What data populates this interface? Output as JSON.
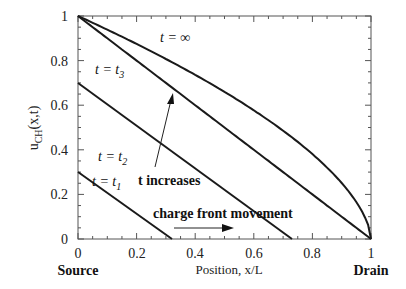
{
  "chart_data": {
    "type": "line",
    "title": "",
    "xlabel": "Position, x/L",
    "ylabel": "u_CH(x,t)",
    "xlim": [
      0,
      1
    ],
    "ylim": [
      0,
      1
    ],
    "grid": false,
    "x_ticks": [
      "0",
      "0.2",
      "0.4",
      "0.6",
      "0.8",
      "1"
    ],
    "y_ticks": [
      "0",
      "0.2",
      "0.4",
      "0.6",
      "0.8",
      "1"
    ],
    "series": [
      {
        "name": "t = t1",
        "x": [
          0,
          0.32
        ],
        "y": [
          0.3,
          0
        ]
      },
      {
        "name": "t = t2",
        "x": [
          0,
          0.73
        ],
        "y": [
          0.7,
          0
        ]
      },
      {
        "name": "t = t3",
        "x": [
          0,
          0.25,
          0.5,
          0.72,
          1
        ],
        "y": [
          1,
          0.75,
          0.5,
          0.28,
          0
        ]
      },
      {
        "name": "t = ∞",
        "x": [
          0,
          0.25,
          0.5,
          0.72,
          0.9,
          1
        ],
        "y": [
          1,
          0.84,
          0.66,
          0.46,
          0.25,
          0
        ]
      }
    ],
    "annotations": [
      {
        "text": "t increases",
        "type": "arrow",
        "from": [
          0.26,
          0.16
        ],
        "to": [
          0.32,
          0.59
        ]
      },
      {
        "text": "charge front movement",
        "type": "arrow",
        "from": [
          0.32,
          0.05
        ],
        "to": [
          0.55,
          0.05
        ]
      },
      {
        "text": "Source",
        "at_x": 0
      },
      {
        "text": "Drain",
        "at_x": 1
      }
    ]
  },
  "labels": {
    "ylabel_main": "u",
    "ylabel_sub": "CH",
    "ylabel_tail": "(x,t)",
    "xlabel": "Position, x/L",
    "source": "Source",
    "drain": "Drain",
    "t_increases": "t  increases",
    "charge_front": "charge  front  movement",
    "t_inf": "t = ∞",
    "t3_main": "t = t",
    "t3_sub": "3",
    "t2_main": "t = t",
    "t2_sub": "2",
    "t1_main": "t = t",
    "t1_sub": "1"
  },
  "ticks": {
    "x": [
      "0",
      "0.2",
      "0.4",
      "0.6",
      "0.8",
      "1"
    ],
    "y": [
      "0",
      "0.2",
      "0.4",
      "0.6",
      "0.8",
      "1"
    ]
  }
}
